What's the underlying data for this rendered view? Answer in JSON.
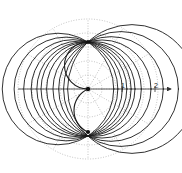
{
  "figure": {
    "kind": "polar-plot",
    "background_color": "#ffffff",
    "width": 182,
    "height": 173
  },
  "chart_data": {
    "type": "line",
    "title": "",
    "subtitle": "",
    "xlabel": "",
    "ylabel": "",
    "projection": "polar",
    "grid": true,
    "legend_position": "none",
    "annotations": [],
    "axis": {
      "name": "horizontal-axis",
      "has_arrow": true,
      "arrow_direction": "right",
      "origin_px": [
        88,
        89
      ],
      "tick_labels": [
        "1",
        "2"
      ],
      "tick_values": [
        1,
        2
      ],
      "tick_px_x": [
        122,
        155
      ],
      "units_per_px": 0.0303,
      "line_color": "#333333"
    },
    "polar_grid": {
      "center_px": [
        88,
        89
      ],
      "grid_color": "#9a9a9a",
      "grid_style": "dotted",
      "radial_spoke_angles_deg": [
        0,
        30,
        60,
        90,
        120,
        150,
        180,
        210,
        240,
        270,
        300,
        330
      ],
      "circle_radii_units": [
        0.42,
        0.85,
        1.27,
        1.7,
        2.12
      ],
      "circle_radii_px": [
        14,
        28,
        42,
        56,
        70
      ],
      "outer_radius_px": 70
    },
    "nodes": {
      "description": "all curves of the family pass through two common node points on the vertical axis",
      "upper_node_px": [
        88,
        42
      ],
      "lower_node_px": [
        88,
        132
      ],
      "node_offset_units": 1.42,
      "marker_color": "#111111",
      "origin_marker_px": [
        88,
        89
      ]
    },
    "curve_family": {
      "name": "coaxial-circles-through-two-nodes",
      "stroke_color": "#1a1a1a",
      "stroke_width_px": 0.9,
      "count": 11,
      "series": [
        {
          "name": "c-left-5",
          "center_offset_x_px": -30,
          "radius_px": 55.6,
          "side": "left"
        },
        {
          "name": "c-left-4",
          "center_offset_x_px": -22,
          "radius_px": 50.0,
          "side": "left"
        },
        {
          "name": "c-left-3",
          "center_offset_x_px": -15,
          "radius_px": 47.4,
          "side": "left"
        },
        {
          "name": "c-left-2",
          "center_offset_x_px": -9,
          "radius_px": 45.9,
          "side": "left"
        },
        {
          "name": "c-left-1",
          "center_offset_x_px": -4,
          "radius_px": 45.2,
          "side": "left"
        },
        {
          "name": "c-center-0",
          "center_offset_x_px": 0,
          "radius_px": 45.0,
          "side": "center"
        },
        {
          "name": "c-right-1",
          "center_offset_x_px": 6,
          "radius_px": 45.4,
          "side": "right"
        },
        {
          "name": "c-right-2",
          "center_offset_x_px": 14,
          "radius_px": 47.1,
          "side": "right"
        },
        {
          "name": "c-right-3",
          "center_offset_x_px": 23,
          "radius_px": 50.5,
          "side": "right"
        },
        {
          "name": "c-right-4",
          "center_offset_x_px": 33,
          "radius_px": 55.8,
          "side": "right"
        },
        {
          "name": "c-right-5",
          "center_offset_x_px": 44,
          "radius_px": 62.9,
          "side": "right"
        }
      ]
    },
    "separatrix": {
      "name": "s-shaped-separatrix",
      "description": "S / yin-yang shaped curve passing through the origin and both nodes",
      "stroke_color": "#1a1a1a",
      "stroke_width_px": 1.1
    }
  }
}
